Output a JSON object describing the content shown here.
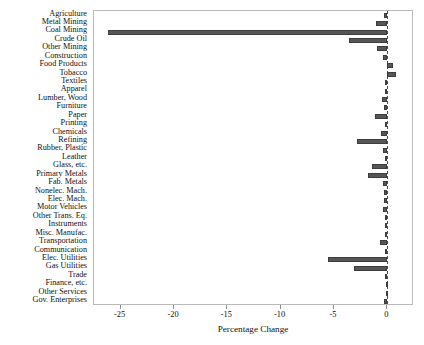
{
  "chart_data": {
    "type": "bar",
    "orientation": "horizontal",
    "title": "",
    "subtitle": "",
    "xlabel": "Percentage Change",
    "ylabel": "",
    "xlim": [
      -27.5,
      2.5
    ],
    "ylim": [
      0,
      35
    ],
    "grid": false,
    "legend": null,
    "legend_position": "none",
    "xticks": [
      -25,
      -20,
      -15,
      -10,
      -5,
      0
    ],
    "xtick_labels": [
      "-25",
      "-20",
      "-15",
      "-10",
      "-5",
      "0"
    ],
    "zero_reference_line": 0,
    "bar_color": "#565656",
    "categories": [
      "Agriculture",
      "Metal Mining",
      "Coal Mining",
      "Crude Oil",
      "Other Mining",
      "Construction",
      "Food Products",
      "Tobacco",
      "Textiles",
      "Apparel",
      "Lumber, Wood",
      "Furniture",
      "Paper",
      "Printing",
      "Chemicals",
      "Refining",
      "Rubber, Plastic",
      "Leather",
      "Glass, etc.",
      "Primary Metals",
      "Fab. Metals",
      "Nonelec. Mach.",
      "Elec. Mach.",
      "Motor Vehicles",
      "Other Trans. Eq.",
      "Instruments",
      "Misc. Manufac.",
      "Transportation",
      "Communication",
      "Elec. Utilities",
      "Gas Utilities",
      "Trade",
      "Finance, etc.",
      "Other Services",
      "Gov. Enterprises"
    ],
    "values": [
      -0.3,
      -1.1,
      -26.2,
      -3.6,
      -1.0,
      -0.4,
      0.5,
      0.8,
      -0.2,
      -0.2,
      -0.5,
      -0.3,
      -1.2,
      -0.2,
      -0.6,
      -2.8,
      -0.4,
      -0.2,
      -1.4,
      -1.8,
      -0.4,
      -0.3,
      -0.3,
      -0.4,
      -0.2,
      -0.2,
      -0.2,
      -0.7,
      -0.2,
      -5.6,
      -3.1,
      -0.2,
      -0.1,
      -0.1,
      -0.3
    ],
    "units": "percent"
  }
}
